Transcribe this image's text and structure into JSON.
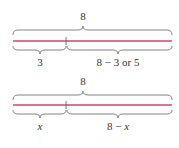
{
  "diagrams": [
    {
      "total_label": "8",
      "left_label": "3",
      "right_label": "8 − 3 or 5"
    },
    {
      "total_label": "8",
      "left_label": "x",
      "right_label_prefix": "8 − ",
      "right_label_var": "x"
    }
  ],
  "colors": {
    "segment": "#d4426e",
    "brace": "#777777",
    "text": "#333333"
  }
}
